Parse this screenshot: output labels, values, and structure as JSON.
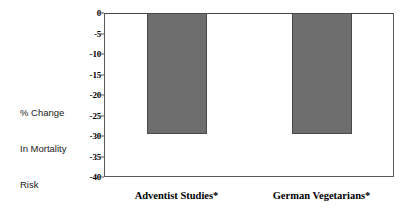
{
  "chart_data": {
    "type": "bar",
    "title": "",
    "subtitle": "",
    "xlabel": "",
    "ylabel": "% Change In Mortality Risk",
    "ylabel_lines": [
      "% Change",
      "In Mortality",
      "Risk"
    ],
    "categories": [
      "Adventist Studies*",
      "German Vegetarians*"
    ],
    "values": [
      -29.5,
      -29.5
    ],
    "ylim": [
      -40,
      0
    ],
    "yticks": [
      0,
      -5,
      -10,
      -15,
      -20,
      -25,
      -30,
      -35,
      -40
    ],
    "ytick_labels": [
      "0",
      "-5",
      "-10",
      "-15",
      "-20",
      "-25",
      "-30",
      "-35",
      "-40"
    ],
    "grid": false,
    "legend": false,
    "legend_position": "none",
    "bar_color": "#6e6e6e",
    "bar_border_color": "#4a4a4a",
    "axis_color": "#5a5a5a",
    "text_color": "#000000",
    "background_color": "#ffffff",
    "annotations": [],
    "footnote": ""
  }
}
